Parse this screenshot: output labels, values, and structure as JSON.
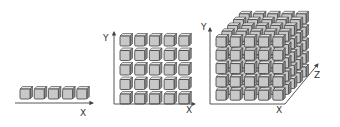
{
  "diagram": {
    "title": "",
    "colors": {
      "cube_front": "#c8c8c8",
      "cube_top": "#e4e4e4",
      "cube_side": "#8a8a8a",
      "cube_edge": "#3c3c3c",
      "axis": "#444444",
      "text": "#333333"
    },
    "panels": [
      {
        "name": "one-dimensional",
        "cubes": {
          "cols": 5,
          "rows": 1,
          "depth": 1
        },
        "axes": [
          {
            "label": "X"
          }
        ]
      },
      {
        "name": "two-dimensional",
        "cubes": {
          "cols": 5,
          "rows": 5,
          "depth": 1
        },
        "axes": [
          {
            "label": "Y"
          },
          {
            "label": "X"
          }
        ]
      },
      {
        "name": "three-dimensional",
        "cubes": {
          "cols": 5,
          "rows": 5,
          "depth": 5
        },
        "axes": [
          {
            "label": "Y"
          },
          {
            "label": "X"
          },
          {
            "label": "Z"
          }
        ]
      }
    ]
  }
}
